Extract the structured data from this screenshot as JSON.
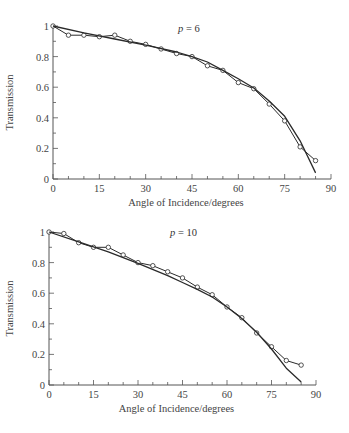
{
  "chart_data": [
    {
      "type": "line",
      "annotation": "p = 6",
      "annotation_var": "p",
      "annotation_val": "= 6",
      "xlabel": "Angle of Incidence/degrees",
      "ylabel": "Transmission",
      "xlim": [
        0,
        90
      ],
      "ylim": [
        0,
        1
      ],
      "xticks": [
        0,
        15,
        30,
        45,
        60,
        75,
        90
      ],
      "yticks": [
        0,
        0.2,
        0.4,
        0.6,
        0.8,
        1
      ],
      "ytick_labels": [
        "0",
        "0.2",
        "0.4",
        "0.6",
        "0.8",
        "1"
      ],
      "grid": false,
      "series": [
        {
          "name": "measured",
          "marker": "open-circle",
          "x": [
            0,
            5,
            10,
            15,
            20,
            25,
            30,
            35,
            40,
            45,
            50,
            55,
            60,
            65,
            70,
            75,
            80,
            85
          ],
          "values": [
            1.0,
            0.94,
            0.94,
            0.93,
            0.94,
            0.9,
            0.88,
            0.85,
            0.82,
            0.8,
            0.74,
            0.71,
            0.63,
            0.59,
            0.49,
            0.38,
            0.21,
            0.12
          ]
        },
        {
          "name": "model",
          "marker": "none",
          "x": [
            0,
            10,
            20,
            30,
            40,
            45,
            50,
            55,
            60,
            65,
            70,
            75,
            80,
            85
          ],
          "values": [
            1.0,
            0.955,
            0.915,
            0.875,
            0.83,
            0.8,
            0.765,
            0.71,
            0.655,
            0.595,
            0.51,
            0.41,
            0.25,
            0.04
          ]
        }
      ]
    },
    {
      "type": "line",
      "annotation": "p = 10",
      "annotation_var": "p",
      "annotation_val": "= 10",
      "xlabel": "Angle of Incidence/degrees",
      "ylabel": "Transmission",
      "xlim": [
        0,
        90
      ],
      "ylim": [
        0,
        1
      ],
      "xticks": [
        0,
        15,
        30,
        45,
        60,
        75,
        90
      ],
      "yticks": [
        0,
        0.2,
        0.4,
        0.6,
        0.8,
        1
      ],
      "ytick_labels": [
        "0",
        "0.2",
        "0.4",
        "0.6",
        "0.8",
        "1"
      ],
      "grid": false,
      "series": [
        {
          "name": "measured",
          "marker": "open-circle",
          "x": [
            0,
            5,
            10,
            15,
            20,
            25,
            30,
            35,
            40,
            45,
            50,
            55,
            60,
            65,
            70,
            75,
            80,
            85
          ],
          "values": [
            1.0,
            0.99,
            0.93,
            0.9,
            0.9,
            0.85,
            0.8,
            0.78,
            0.74,
            0.7,
            0.64,
            0.59,
            0.51,
            0.44,
            0.34,
            0.25,
            0.16,
            0.13
          ]
        },
        {
          "name": "model",
          "marker": "none",
          "x": [
            0,
            10,
            20,
            30,
            40,
            45,
            50,
            55,
            60,
            65,
            70,
            75,
            80,
            85
          ],
          "values": [
            1.0,
            0.935,
            0.87,
            0.795,
            0.715,
            0.67,
            0.625,
            0.575,
            0.51,
            0.435,
            0.345,
            0.235,
            0.11,
            0.02
          ]
        }
      ]
    }
  ]
}
